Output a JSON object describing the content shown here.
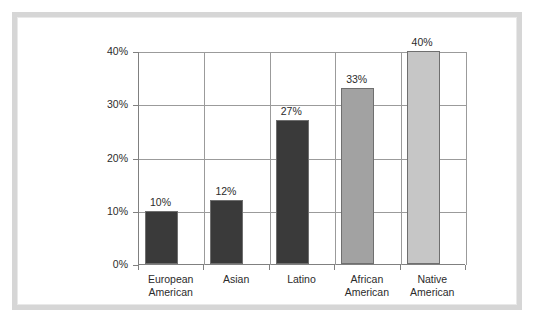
{
  "frame": {
    "border_color": "#d6d6d6"
  },
  "chart_data": {
    "type": "bar",
    "title": "",
    "subtitle": "",
    "xlabel": "",
    "ylabel": "",
    "categories": [
      "European American",
      "Asian",
      "Latino",
      "African American",
      "Native American"
    ],
    "category_lines": [
      [
        "European",
        "American"
      ],
      [
        "Asian",
        ""
      ],
      [
        "Latino",
        ""
      ],
      [
        "African",
        "American"
      ],
      [
        "Native",
        "American"
      ]
    ],
    "values": [
      10,
      12,
      27,
      33,
      40
    ],
    "value_labels": [
      "10%",
      "12%",
      "27%",
      "33%",
      "40%"
    ],
    "bar_colors": [
      "#3a3a3a",
      "#3a3a3a",
      "#3a3a3a",
      "#a2a2a2",
      "#c6c6c6"
    ],
    "ylim": [
      0,
      40
    ],
    "yticks": [
      0,
      10,
      20,
      30,
      40
    ],
    "ytick_labels": [
      "0%",
      "10%",
      "20%",
      "30%",
      "40%"
    ],
    "grid": true,
    "legend": "none",
    "axis_color": "#808080",
    "grid_color": "#9b9b9b"
  }
}
